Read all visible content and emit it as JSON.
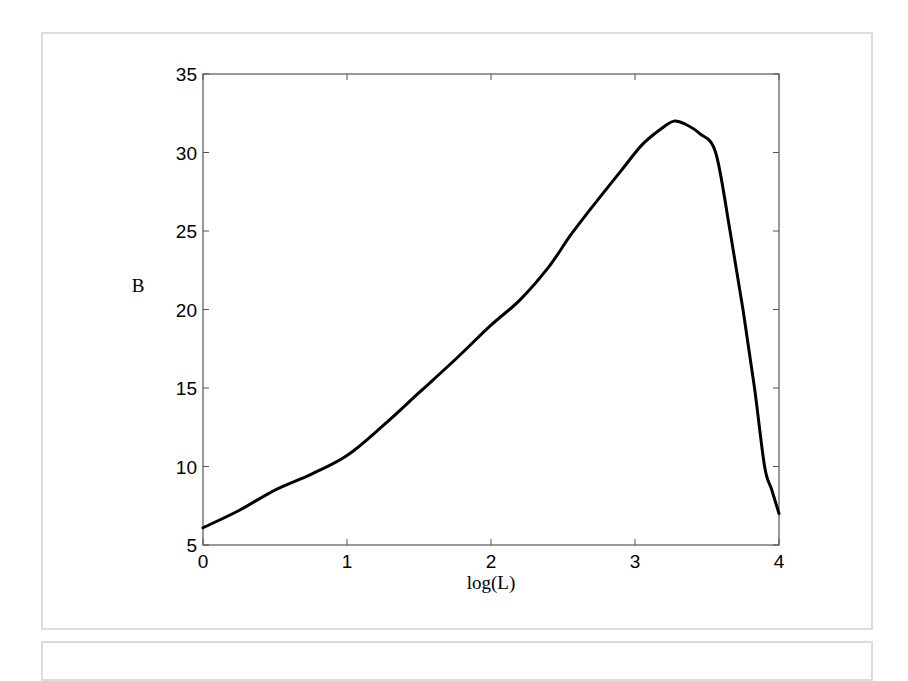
{
  "chart_data": {
    "type": "line",
    "title": "",
    "xlabel": "log(L)",
    "ylabel": "B",
    "xlim": [
      0,
      4
    ],
    "ylim": [
      5,
      35
    ],
    "x_ticks": [
      0,
      1,
      2,
      3,
      4
    ],
    "y_ticks": [
      5,
      10,
      15,
      20,
      25,
      30,
      35
    ],
    "x_tick_labels": [
      "0",
      "1",
      "2",
      "3",
      "4"
    ],
    "y_tick_labels": [
      "5",
      "10",
      "15",
      "20",
      "25",
      "30",
      "35"
    ],
    "grid": false,
    "legend": null,
    "line_color": "#000000",
    "series": [
      {
        "name": "B",
        "x": [
          0,
          0.25,
          0.5,
          0.75,
          1.0,
          1.25,
          1.5,
          1.75,
          2.0,
          2.2,
          2.4,
          2.55,
          2.7,
          2.9,
          3.05,
          3.18,
          3.27,
          3.35,
          3.45,
          3.56,
          3.66,
          3.75,
          3.83,
          3.9,
          3.95,
          4.0
        ],
        "y": [
          6.1,
          7.2,
          8.5,
          9.5,
          10.7,
          12.6,
          14.7,
          16.8,
          19.0,
          20.6,
          22.7,
          24.7,
          26.5,
          28.8,
          30.5,
          31.5,
          32.0,
          31.8,
          31.2,
          30.0,
          25.0,
          20.0,
          15.0,
          10.0,
          8.5,
          7.0
        ]
      }
    ]
  }
}
